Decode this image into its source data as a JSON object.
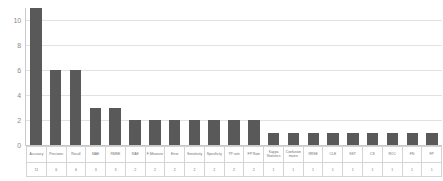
{
  "chart_data": {
    "type": "bar",
    "title": "",
    "xlabel": "",
    "ylabel": "",
    "ylim": [
      0,
      11
    ],
    "y_ticks": [
      0,
      2,
      4,
      6,
      8,
      10
    ],
    "grid": true,
    "legend": "none",
    "data_table_visible": true,
    "bar_color": "#595959",
    "gridline_color": "#e2e2e2",
    "axis_color": "#c9c9c9",
    "categories": [
      "Accuracy",
      "Precision",
      "Recall",
      "MAE",
      "RMSE",
      "RAE",
      "F-Measure",
      "Error",
      "Sensitivity",
      "Specificity",
      "TP rate",
      "FP Rate",
      "Kappa Statistics",
      "Confusion matrix",
      "RRSE",
      "CLE",
      "SST",
      "CS",
      "ROC",
      "FN",
      "FP"
    ],
    "values": [
      11,
      6,
      6,
      3,
      3,
      2,
      2,
      2,
      2,
      2,
      2,
      2,
      1,
      1,
      1,
      1,
      1,
      1,
      1,
      1,
      1
    ],
    "value_labels": [
      "11",
      "6",
      "6",
      "3",
      "3",
      "2",
      "2",
      "2",
      "2",
      "2",
      "2",
      "2",
      "1",
      "1",
      "1",
      "1",
      "1",
      "1",
      "1",
      "1",
      "1"
    ]
  }
}
